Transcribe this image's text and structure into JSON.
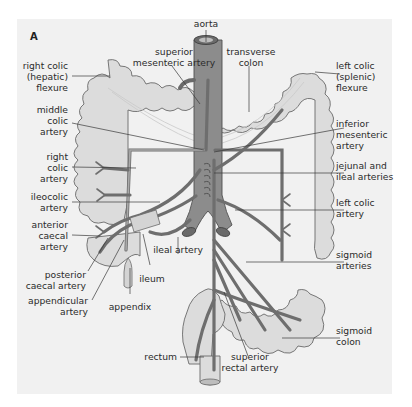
{
  "figure": {
    "panel_label": "A",
    "background_color": "#f1f1f1",
    "colon_fill": "#dcdcdc",
    "vessel_color": "#6e6e6e"
  },
  "labels": {
    "aorta": "aorta",
    "superior_mesenteric_artery": [
      "superior",
      "mesenteric artery"
    ],
    "transverse_colon": [
      "transverse",
      "colon"
    ],
    "right_colic_flexure": [
      "right colic",
      "(hepatic)",
      "flexure"
    ],
    "left_colic_flexure": [
      "left colic",
      "(splenic)",
      "flexure"
    ],
    "middle_colic_artery": [
      "middle",
      "colic",
      "artery"
    ],
    "inferior_mesenteric_artery": [
      "inferior",
      "mesenteric",
      "artery"
    ],
    "right_colic_artery": [
      "right",
      "colic",
      "artery"
    ],
    "jejunal_ileal_arteries": [
      "jejunal and",
      "ileal arteries"
    ],
    "ileocolic_artery": [
      "ileocolic",
      "artery"
    ],
    "left_colic_artery": [
      "left colic",
      "artery"
    ],
    "anterior_caecal_artery": [
      "anterior",
      "caecal",
      "artery"
    ],
    "ileal_artery": "ileal artery",
    "sigmoid_arteries": [
      "sigmoid",
      "arteries"
    ],
    "posterior_caecal_artery": [
      "posterior",
      "caecal artery"
    ],
    "ileum": "ileum",
    "appendicular_artery": [
      "appendicular",
      "artery"
    ],
    "appendix": "appendix",
    "sigmoid_colon": [
      "sigmoid",
      "colon"
    ],
    "rectum": "rectum",
    "superior_rectal_artery": [
      "superior",
      "rectal artery"
    ]
  }
}
